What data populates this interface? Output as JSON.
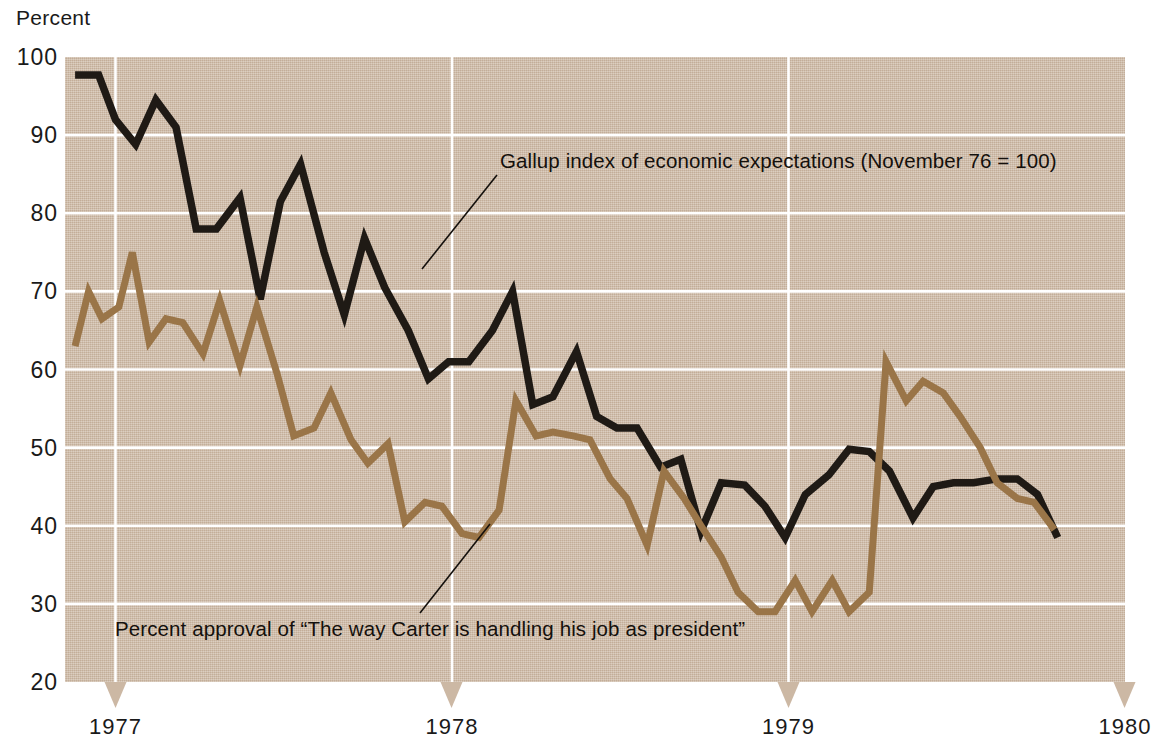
{
  "axis": {
    "y_title": "Percent",
    "y_ticks": [
      100,
      90,
      80,
      70,
      60,
      50,
      40,
      30,
      20
    ],
    "y_tick_labels": [
      "100",
      "90",
      "80",
      "70",
      "60",
      "50",
      "40",
      "30",
      "20"
    ],
    "x_tick_labels": [
      "1977",
      "1978",
      "1979",
      "1980"
    ]
  },
  "annotations": {
    "gallup": "Gallup index of economic expectations (November 76 = 100)",
    "carter": "Percent approval of “The way Carter is handling his job as president”"
  },
  "colors": {
    "background": "#ffffff",
    "plot_background": "#ccb8a4",
    "gridline": "#ffffff",
    "gallup_line": "#1f1a15",
    "carter_line": "#9a7548",
    "text": "#1a1a1a"
  },
  "chart_data": {
    "type": "line",
    "title": "",
    "subtitle": "",
    "xlabel": "",
    "ylabel": "Percent",
    "ylim": [
      20,
      100
    ],
    "xlim": [
      1976.85,
      1980.0
    ],
    "grid": true,
    "legend": "annotation-labels",
    "x_tick_values": [
      1977.0,
      1978.0,
      1979.0,
      1980.0
    ],
    "y_tick_values": [
      20,
      30,
      40,
      50,
      60,
      70,
      80,
      90,
      100
    ],
    "series": [
      {
        "name": "Gallup index of economic expectations (November 76 = 100)",
        "color": "#1f1a15",
        "x": [
          1976.88,
          1976.95,
          1977.0,
          1977.06,
          1977.12,
          1977.18,
          1977.24,
          1977.3,
          1977.37,
          1977.43,
          1977.49,
          1977.55,
          1977.62,
          1977.68,
          1977.74,
          1977.8,
          1977.87,
          1977.93,
          1977.99,
          1978.05,
          1978.12,
          1978.18,
          1978.24,
          1978.3,
          1978.37,
          1978.43,
          1978.49,
          1978.55,
          1978.62,
          1978.68,
          1978.74,
          1978.8,
          1978.87,
          1978.93,
          1978.99,
          1979.05,
          1979.12,
          1979.18,
          1979.24,
          1979.3,
          1979.37,
          1979.43,
          1979.49,
          1979.55,
          1979.62,
          1979.68,
          1979.74,
          1979.8
        ],
        "y": [
          97.7,
          97.7,
          92.0,
          88.8,
          94.5,
          91.0,
          78.0,
          78.0,
          82.0,
          69.0,
          81.5,
          86.3,
          75.0,
          67.0,
          76.8,
          70.5,
          65.0,
          58.8,
          61.0,
          61.0,
          65.0,
          70.0,
          55.5,
          56.5,
          62.3,
          54.0,
          52.5,
          52.5,
          47.5,
          48.5,
          39.3,
          45.5,
          45.2,
          42.5,
          38.5,
          44.0,
          46.5,
          49.8,
          49.5,
          47.0,
          41.0,
          45.0,
          45.5,
          45.5,
          46.0,
          46.0,
          44.0,
          38.5
        ]
      },
      {
        "name": "Percent approval of “The way Carter is handling his job as president”",
        "color": "#9a7548",
        "x": [
          1976.88,
          1976.92,
          1976.96,
          1977.01,
          1977.05,
          1977.1,
          1977.15,
          1977.2,
          1977.26,
          1977.31,
          1977.37,
          1977.42,
          1977.48,
          1977.53,
          1977.59,
          1977.64,
          1977.7,
          1977.75,
          1977.81,
          1977.86,
          1977.92,
          1977.97,
          1978.03,
          1978.08,
          1978.14,
          1978.19,
          1978.25,
          1978.3,
          1978.36,
          1978.41,
          1978.47,
          1978.52,
          1978.58,
          1978.63,
          1978.69,
          1978.74,
          1978.8,
          1978.85,
          1978.91,
          1978.96,
          1979.02,
          1979.07,
          1979.13,
          1979.18,
          1979.24,
          1979.29,
          1979.35,
          1979.4,
          1979.46,
          1979.51,
          1979.57,
          1979.62,
          1979.68,
          1979.73,
          1979.79
        ],
        "y": [
          63.0,
          70.0,
          66.5,
          68.0,
          75.0,
          63.5,
          66.5,
          66.0,
          62.0,
          68.8,
          60.5,
          68.0,
          59.5,
          51.5,
          52.5,
          57.0,
          51.0,
          48.0,
          50.5,
          40.5,
          43.0,
          42.5,
          39.0,
          38.5,
          42.0,
          56.0,
          51.5,
          52.0,
          51.5,
          51.0,
          46.0,
          43.5,
          37.5,
          47.0,
          43.5,
          40.0,
          36.0,
          31.5,
          29.0,
          29.0,
          33.0,
          29.0,
          33.0,
          29.0,
          31.5,
          61.0,
          56.0,
          58.5,
          57.0,
          54.0,
          50.0,
          45.5,
          43.5,
          43.0,
          39.5
        ]
      }
    ]
  }
}
